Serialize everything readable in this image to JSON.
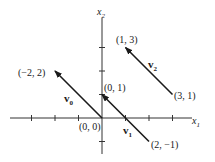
{
  "axes": {
    "x_label": "x",
    "x_sub": "1",
    "y_label": "x",
    "y_sub": "2",
    "x_ticks": [
      -3,
      -2,
      -1,
      1,
      2,
      3
    ],
    "y_ticks": [
      -1,
      1,
      2,
      3
    ]
  },
  "vectors": [
    {
      "name": "v",
      "sub": "0",
      "from": [
        0,
        0
      ],
      "to": [
        -2,
        2
      ]
    },
    {
      "name": "v",
      "sub": "1",
      "from": [
        2,
        -1
      ],
      "to": [
        0,
        1
      ]
    },
    {
      "name": "v",
      "sub": "2",
      "from": [
        3,
        1
      ],
      "to": [
        1,
        3
      ]
    }
  ],
  "points": [
    {
      "text": "(0, 0)"
    },
    {
      "text": "(−2, 2)"
    },
    {
      "text": "(0, 1)"
    },
    {
      "text": "(2, −1)"
    },
    {
      "text": "(1, 3)"
    },
    {
      "text": "(3, 1)"
    }
  ],
  "colors": {
    "ink": "#1a1a1a"
  }
}
